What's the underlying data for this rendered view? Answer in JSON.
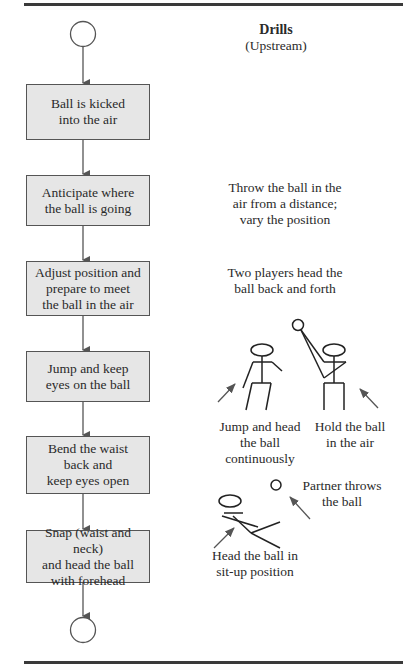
{
  "header": {
    "title": "Drills",
    "subtitle": "(Upstream)"
  },
  "flowchart": {
    "steps": [
      {
        "label": "Ball is kicked\ninto the air"
      },
      {
        "label": "Anticipate where\nthe ball is going"
      },
      {
        "label": "Adjust position and\nprepare to meet\nthe ball in the air"
      },
      {
        "label": "Jump and keep\neyes on the ball"
      },
      {
        "label": "Bend the waist\nback and\nkeep eyes open"
      },
      {
        "label": "Snap (waist and neck)\nand head the ball\nwith forehead"
      }
    ]
  },
  "drills": [
    {
      "label": "Throw the ball in the\nair from a distance;\nvary the position"
    },
    {
      "label": "Two players head the\nball back and forth"
    },
    {
      "label": "Jump and head\nthe ball\ncontinuously"
    },
    {
      "label": "Hold the ball\nin the air"
    },
    {
      "label": "Partner throws\nthe ball"
    },
    {
      "label": "Head the ball in\nsit-up position"
    }
  ],
  "colors": {
    "box_fill": "#e6e6e6",
    "line": "#555555",
    "rule": "#3a3a3a"
  }
}
